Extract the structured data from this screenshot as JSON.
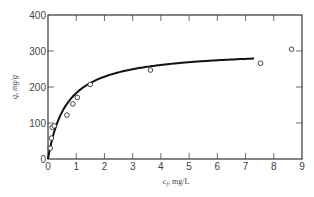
{
  "chart_data": {
    "type": "scatter",
    "title": "",
    "xlabel": "c_f, mg/L",
    "xlabel_parts": {
      "var": "c",
      "sub": "f",
      "unit": ", mg/L"
    },
    "ylabel": "q, mg/g",
    "ylabel_parts": {
      "var": "q",
      "unit": ", mg/g"
    },
    "xlim": [
      0,
      9
    ],
    "ylim": [
      0,
      400
    ],
    "xticks": [
      0,
      1,
      2,
      3,
      4,
      5,
      6,
      7,
      8,
      9
    ],
    "xtick_labels": [
      "0",
      "1",
      "2",
      "3",
      "4",
      "5",
      "6",
      "7",
      "8",
      "9"
    ],
    "yticks": [
      0,
      100,
      200,
      300,
      400
    ],
    "ytick_labels": [
      "0",
      "100",
      "200",
      "300",
      "400"
    ],
    "grid": false,
    "legend": null,
    "series": [
      {
        "name": "experimental data",
        "kind": "scatter",
        "marker": "open-circle",
        "points": [
          {
            "x": 0.08,
            "y": 30
          },
          {
            "x": 0.12,
            "y": 58
          },
          {
            "x": 0.15,
            "y": 88
          },
          {
            "x": 0.22,
            "y": 92
          },
          {
            "x": 0.67,
            "y": 122
          },
          {
            "x": 0.88,
            "y": 153
          },
          {
            "x": 1.04,
            "y": 171
          },
          {
            "x": 1.5,
            "y": 207
          },
          {
            "x": 3.63,
            "y": 247
          },
          {
            "x": 7.53,
            "y": 266
          },
          {
            "x": 8.63,
            "y": 305
          }
        ]
      },
      {
        "name": "fitted isotherm",
        "kind": "line",
        "model": "langmuir",
        "params": {
          "qm": 304.6,
          "K": 1.506
        },
        "x_range": [
          0,
          7.3
        ]
      }
    ]
  }
}
